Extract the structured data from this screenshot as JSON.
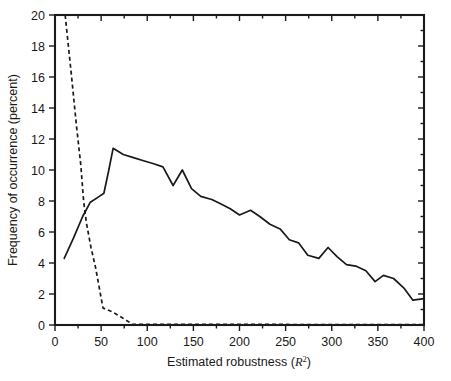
{
  "chart_data": {
    "type": "line",
    "title": "",
    "xlabel": "Estimated robustness (R2)",
    "xlabel_text": "Estimated robustness",
    "xlabel_math": "R",
    "xlabel_math_sup": "2",
    "ylabel": "Frequency of occurrence (percent)",
    "xlim": [
      0,
      400
    ],
    "ylim": [
      0,
      20
    ],
    "xticks": [
      0,
      50,
      100,
      150,
      200,
      250,
      300,
      350,
      400
    ],
    "yticks": [
      0,
      2,
      4,
      6,
      8,
      10,
      12,
      14,
      16,
      18,
      20
    ],
    "xtick_labels": [
      "0",
      "50",
      "100",
      "150",
      "200",
      "250",
      "300",
      "350",
      "400"
    ],
    "ytick_labels": [
      "0",
      "2",
      "4",
      "6",
      "8",
      "10",
      "12",
      "14",
      "16",
      "18",
      "20"
    ],
    "x_minor_ticks": [
      25,
      75,
      125,
      175,
      225,
      275,
      325,
      375
    ],
    "y_minor_ticks": [
      1,
      3,
      5,
      7,
      9,
      11,
      13,
      15,
      17,
      19
    ],
    "grid": false,
    "legend": "none",
    "frame": "box",
    "tick_direction": "out-left-bottom-in-top-right",
    "colors": {
      "axis": "#1a1a1a",
      "solid_series": "#1a1a1a",
      "dashed_series": "#1a1a1a",
      "background": "#ffffff"
    },
    "series": [
      {
        "name": "solid-curve",
        "style": "solid",
        "points": [
          [
            10,
            4.3
          ],
          [
            20,
            5.6
          ],
          [
            30,
            7.0
          ],
          [
            38,
            7.9
          ],
          [
            48,
            8.3
          ],
          [
            53,
            8.5
          ],
          [
            58,
            9.9
          ],
          [
            63,
            11.4
          ],
          [
            74,
            11.0
          ],
          [
            85,
            10.8
          ],
          [
            96,
            10.6
          ],
          [
            107,
            10.4
          ],
          [
            117,
            10.2
          ],
          [
            128,
            9.0
          ],
          [
            138,
            10.0
          ],
          [
            148,
            8.8
          ],
          [
            158,
            8.3
          ],
          [
            170,
            8.1
          ],
          [
            180,
            7.8
          ],
          [
            190,
            7.5
          ],
          [
            200,
            7.1
          ],
          [
            212,
            7.4
          ],
          [
            222,
            7.0
          ],
          [
            233,
            6.5
          ],
          [
            244,
            6.2
          ],
          [
            254,
            5.5
          ],
          [
            264,
            5.3
          ],
          [
            274,
            4.5
          ],
          [
            286,
            4.3
          ],
          [
            296,
            5.0
          ],
          [
            306,
            4.4
          ],
          [
            316,
            3.9
          ],
          [
            326,
            3.8
          ],
          [
            337,
            3.5
          ],
          [
            347,
            2.8
          ],
          [
            356,
            3.2
          ],
          [
            367,
            3.0
          ],
          [
            378,
            2.4
          ],
          [
            388,
            1.6
          ],
          [
            400,
            1.7
          ]
        ]
      },
      {
        "name": "dashed-curve",
        "style": "dashed",
        "points": [
          [
            11,
            20.0
          ],
          [
            18,
            16.0
          ],
          [
            23,
            13.0
          ],
          [
            28,
            10.3
          ],
          [
            31,
            8.0
          ],
          [
            34,
            6.6
          ],
          [
            39,
            5.0
          ],
          [
            44,
            3.7
          ],
          [
            48,
            2.4
          ],
          [
            52,
            1.1
          ],
          [
            62,
            0.85
          ],
          [
            72,
            0.5
          ],
          [
            84,
            0.05
          ],
          [
            400,
            0.02
          ]
        ]
      }
    ]
  }
}
